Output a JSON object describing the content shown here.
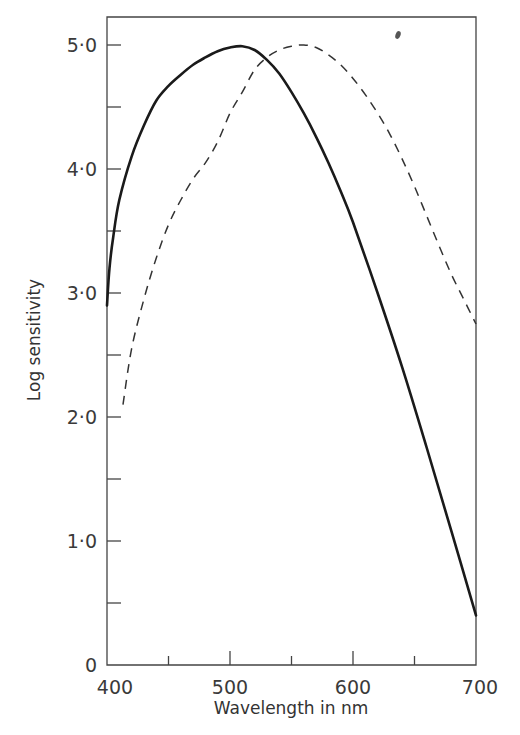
{
  "chart_data": {
    "type": "line",
    "title": "",
    "xlabel": "Wavelength in nm",
    "ylabel": "Log sensitivity",
    "xlim": [
      400,
      700
    ],
    "ylim": [
      0,
      5.2
    ],
    "grid": false,
    "legend": null,
    "x_ticks": [
      400,
      450,
      500,
      550,
      600,
      650,
      700
    ],
    "x_tick_labels": [
      "400",
      "",
      "500",
      "",
      "600",
      "",
      "700"
    ],
    "y_ticks": [
      0,
      0.5,
      1.0,
      1.5,
      2.0,
      2.5,
      3.0,
      3.5,
      4.0,
      4.5,
      5.0
    ],
    "y_tick_labels": [
      "0",
      "",
      "1·0",
      "",
      "2·0",
      "",
      "3·0",
      "",
      "4·0",
      "",
      "5·0"
    ],
    "series": [
      {
        "name": "solid curve",
        "style": "solid",
        "x": [
          400,
          402,
          405,
          410,
          420,
          430,
          440,
          450,
          460,
          470,
          480,
          490,
          500,
          510,
          520,
          530,
          540,
          550,
          560,
          570,
          580,
          590,
          600,
          620,
          640,
          660,
          680,
          700
        ],
        "y": [
          2.9,
          3.2,
          3.45,
          3.75,
          4.1,
          4.35,
          4.55,
          4.67,
          4.76,
          4.84,
          4.9,
          4.95,
          4.98,
          4.99,
          4.96,
          4.88,
          4.77,
          4.62,
          4.45,
          4.26,
          4.05,
          3.82,
          3.57,
          3.0,
          2.4,
          1.75,
          1.08,
          0.4
        ]
      },
      {
        "name": "dashed curve",
        "style": "dashed",
        "x": [
          413,
          420,
          430,
          440,
          450,
          460,
          470,
          480,
          490,
          500,
          510,
          520,
          530,
          540,
          550,
          560,
          570,
          580,
          590,
          600,
          610,
          620,
          630,
          640,
          650,
          660,
          670,
          680,
          690,
          700
        ],
        "y": [
          2.1,
          2.55,
          2.95,
          3.28,
          3.55,
          3.75,
          3.92,
          4.05,
          4.22,
          4.45,
          4.62,
          4.8,
          4.9,
          4.96,
          4.99,
          5.0,
          4.98,
          4.92,
          4.84,
          4.73,
          4.6,
          4.45,
          4.28,
          4.08,
          3.86,
          3.62,
          3.38,
          3.15,
          2.95,
          2.75
        ]
      }
    ]
  }
}
